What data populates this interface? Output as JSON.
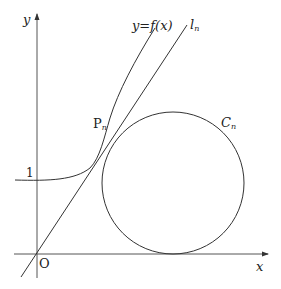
{
  "figure": {
    "axes": {
      "x_label": "x",
      "y_label": "y",
      "origin_label": "O",
      "y_tick_label": "1"
    },
    "curve": {
      "label_lhs": "y",
      "label_eq": "=",
      "label_rhs": "f(x)"
    },
    "tangent_line": {
      "label": "l",
      "subscript": "n"
    },
    "point": {
      "label": "P",
      "subscript": "n"
    },
    "circle": {
      "label": "C",
      "subscript": "n"
    },
    "colors": {
      "stroke": "#333333",
      "background": "#ffffff"
    }
  }
}
